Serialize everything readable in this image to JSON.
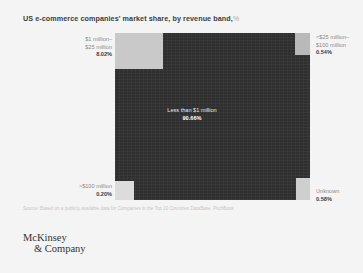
{
  "title": {
    "text": "US e-commerce companies' market share, by revenue band,",
    "unit": "%"
  },
  "source": {
    "text": "Source: Based on a publicly available data for Companies in the Top 10 Countries DataBase, PitchBook"
  },
  "logo": {
    "line1": "McKinsey",
    "line2": "& Company"
  },
  "chart_data": {
    "type": "treemap",
    "unit": "%",
    "categories": [
      "Less than $1 million",
      "$1 million–$25 million",
      "<$25 million–$100 million",
      "Unknown",
      ">$100 million"
    ],
    "values": [
      90.66,
      8.02,
      0.54,
      0.58,
      0.2
    ],
    "segments": [
      {
        "id": "less-than-1m",
        "label_line1": "Less than $1 million",
        "label_line2": "",
        "percent": "90.66%",
        "value": 90.66,
        "color": "#2f2f2f",
        "label_position": "center-inside"
      },
      {
        "id": "1m-25m",
        "label_line1": "$1 million–",
        "label_line2": "$25 million",
        "percent": "8.02%",
        "value": 8.02,
        "color": "#c9c9c9",
        "label_position": "left-top"
      },
      {
        "id": "25m-100m",
        "label_line1": "<$25 million–",
        "label_line2": "$100 million",
        "percent": "0.54%",
        "value": 0.54,
        "color": "#b9b9b9",
        "label_position": "right-top"
      },
      {
        "id": "unknown",
        "label_line1": "Unknown",
        "label_line2": "",
        "percent": "0.58%",
        "value": 0.58,
        "color": "#cfcfcf",
        "label_position": "right-bottom"
      },
      {
        "id": "over-100m",
        "label_line1": ">$100 million",
        "label_line2": "",
        "percent": "0.20%",
        "value": 0.2,
        "color": "#dcdcdc",
        "label_position": "left-bottom"
      }
    ],
    "legend": "none",
    "grid": false,
    "background": "#f4f4f4"
  }
}
